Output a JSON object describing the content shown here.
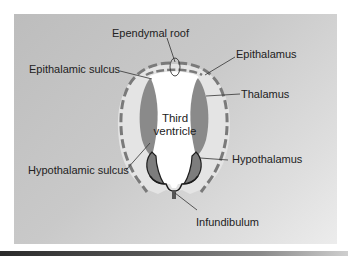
{
  "diagram": {
    "labels": {
      "ependymal_roof": "Ependymal roof",
      "epithalamic_sulcus": "Epithalamic sulcus",
      "epithalamus": "Epithalamus",
      "thalamus": "Thalamus",
      "third_ventricle_line1": "Third",
      "third_ventricle_line2": "ventricle",
      "hypothalamic_sulcus": "Hypothalamic sulcus",
      "hypothalamus": "Hypothalamus",
      "infundibulum": "Infundibulum"
    },
    "colors": {
      "panel_background": "#c6c6c6",
      "outer_wall": "#e4e4e4",
      "dashed_membrane": "#7a7a7a",
      "thalamus_fill": "#8a8a8a",
      "hypothalamus_fill": "#7d7d7d",
      "ventricle_fill": "#ffffff",
      "outline": "#1e1e1e",
      "leader_line": "#333333"
    }
  }
}
